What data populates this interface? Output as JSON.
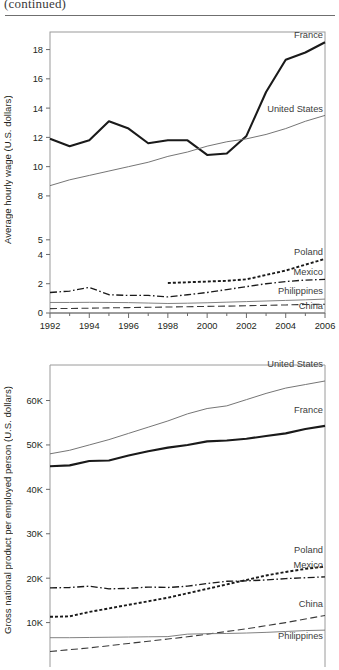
{
  "header": {
    "continued_note": "(continued)"
  },
  "chart_data": [
    {
      "id": "chart-hourly-wage",
      "type": "line",
      "title": "",
      "xlabel": "",
      "ylabel": "Average hourly wage (U.S. dollars)",
      "xlim": [
        1992,
        2006
      ],
      "ylim": [
        0,
        19.2
      ],
      "xticks": [
        1992,
        1994,
        1996,
        1998,
        2000,
        2002,
        2004,
        2006
      ],
      "xtick_labels": [
        "1992",
        "1994",
        "1996",
        "1998",
        "2000",
        "2002",
        "2004",
        "2006"
      ],
      "yticks": [
        0,
        2,
        4,
        5,
        8,
        10,
        12,
        14,
        16,
        18
      ],
      "ytick_labels": [
        "0",
        "2",
        "4",
        "5",
        "8",
        "10",
        "12",
        "14",
        "16",
        "18"
      ],
      "grid": false,
      "legend_position": "inline-right-of-line-ends",
      "x": [
        1992,
        1993,
        1994,
        1995,
        1996,
        1997,
        1998,
        1999,
        2000,
        2001,
        2002,
        2003,
        2004,
        2005,
        2006
      ],
      "series": [
        {
          "name": "France",
          "style": "solid-thick-black",
          "color": "#1a1a1a",
          "values": [
            11.9,
            11.4,
            11.8,
            13.1,
            12.6,
            11.6,
            11.8,
            11.8,
            10.8,
            10.9,
            12.1,
            15.1,
            17.3,
            17.8,
            18.5
          ]
        },
        {
          "name": "United States",
          "style": "solid-thin-gray",
          "color": "#6e6e6e",
          "values": [
            8.7,
            9.1,
            9.4,
            9.7,
            10.0,
            10.3,
            10.7,
            11.0,
            11.4,
            11.7,
            11.9,
            12.2,
            12.6,
            13.1,
            13.5
          ]
        },
        {
          "name": "Poland",
          "style": "dotted",
          "color": "#1a1a1a",
          "values": [
            null,
            null,
            null,
            null,
            null,
            null,
            2.05,
            2.1,
            2.15,
            2.2,
            2.3,
            2.6,
            2.9,
            3.3,
            3.7
          ]
        },
        {
          "name": "Mexico",
          "style": "dash-dot",
          "color": "#1a1a1a",
          "values": [
            1.4,
            1.5,
            1.75,
            1.25,
            1.2,
            1.2,
            1.1,
            1.25,
            1.4,
            1.6,
            1.8,
            2.0,
            2.15,
            2.25,
            2.3
          ]
        },
        {
          "name": "Philippines",
          "style": "solid-thin-gray",
          "color": "#7a7a7a",
          "values": [
            0.72,
            0.72,
            0.73,
            0.72,
            0.71,
            0.68,
            0.65,
            0.67,
            0.7,
            0.74,
            0.78,
            0.82,
            0.86,
            0.9,
            0.95
          ]
        },
        {
          "name": "China",
          "style": "long-dash",
          "color": "#3a3a3a",
          "values": [
            0.3,
            0.31,
            0.33,
            0.35,
            0.37,
            0.39,
            0.41,
            0.43,
            0.45,
            0.47,
            0.5,
            0.52,
            0.55,
            0.58,
            0.6
          ]
        }
      ]
    },
    {
      "id": "chart-gnp-per-employed",
      "type": "line",
      "title": "",
      "xlabel": "",
      "ylabel": "Gross national product per employed person (U.S. dollars)",
      "xlim": [
        1992,
        2006
      ],
      "ylim": [
        0,
        68000
      ],
      "yticks": [
        10000,
        20000,
        30000,
        40000,
        50000,
        60000
      ],
      "ytick_labels": [
        "10K",
        "20K",
        "30K",
        "40K",
        "50K",
        "60K"
      ],
      "grid": false,
      "legend_position": "inline-right-of-line-ends",
      "x": [
        1992,
        1993,
        1994,
        1995,
        1996,
        1997,
        1998,
        1999,
        2000,
        2001,
        2002,
        2003,
        2004,
        2005,
        2006
      ],
      "series": [
        {
          "name": "United States",
          "style": "solid-thin-gray",
          "color": "#6e6e6e",
          "values": [
            48000,
            48800,
            50000,
            51200,
            52600,
            54000,
            55400,
            57000,
            58200,
            58800,
            60200,
            61600,
            62800,
            63600,
            64400
          ]
        },
        {
          "name": "France",
          "style": "solid-thick-black",
          "color": "#1a1a1a",
          "values": [
            45200,
            45400,
            46400,
            46500,
            47600,
            48600,
            49400,
            50000,
            50800,
            51000,
            51400,
            52000,
            52600,
            53600,
            54300
          ]
        },
        {
          "name": "Poland",
          "style": "dotted",
          "color": "#1a1a1a",
          "values": [
            11300,
            11400,
            12400,
            13200,
            14000,
            14800,
            15600,
            16600,
            17600,
            18600,
            19600,
            20600,
            21400,
            22100,
            22600
          ]
        },
        {
          "name": "Mexico",
          "style": "dash-dot",
          "color": "#1a1a1a",
          "values": [
            17800,
            17900,
            18200,
            17600,
            17700,
            18000,
            17900,
            18200,
            18800,
            19300,
            19400,
            19600,
            19900,
            20100,
            20300
          ]
        },
        {
          "name": "China",
          "style": "long-dash",
          "color": "#3a3a3a",
          "values": [
            3500,
            3900,
            4300,
            4800,
            5300,
            5800,
            6300,
            6800,
            7400,
            8000,
            8600,
            9300,
            10000,
            10800,
            11600
          ]
        },
        {
          "name": "Philippines",
          "style": "solid-thin-gray",
          "color": "#7a7a7a",
          "values": [
            6600,
            6600,
            6650,
            6700,
            6750,
            6800,
            6850,
            7400,
            7500,
            7550,
            7650,
            7800,
            8000,
            8200,
            8300
          ]
        }
      ]
    }
  ]
}
